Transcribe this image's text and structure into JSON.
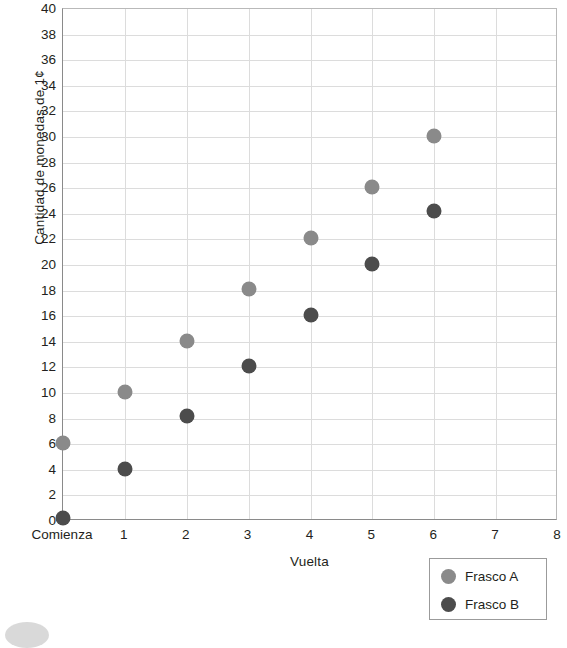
{
  "chart_data": {
    "type": "scatter",
    "title": "",
    "xlabel": "Vuelta",
    "ylabel": "Cantidad de monedas de 1¢",
    "xlim": [
      0,
      8
    ],
    "ylim": [
      0,
      40
    ],
    "grid": true,
    "x_tick_labels": [
      "Comienza",
      "1",
      "2",
      "3",
      "4",
      "5",
      "6",
      "7",
      "8"
    ],
    "x_tick_values": [
      0,
      1,
      2,
      3,
      4,
      5,
      6,
      7,
      8
    ],
    "y_tick_labels": [
      "0",
      "2",
      "4",
      "6",
      "8",
      "10",
      "12",
      "14",
      "16",
      "18",
      "20",
      "22",
      "24",
      "26",
      "28",
      "30",
      "32",
      "34",
      "36",
      "38",
      "40"
    ],
    "y_tick_values": [
      0,
      2,
      4,
      6,
      8,
      10,
      12,
      14,
      16,
      18,
      20,
      22,
      24,
      26,
      28,
      30,
      32,
      34,
      36,
      38,
      40
    ],
    "legend_position": "bottom-right",
    "series": [
      {
        "name": "Frasco A",
        "color": "#8a8a8a",
        "marker": "circle",
        "x": [
          0,
          1,
          2,
          3,
          4,
          5,
          6
        ],
        "values": [
          6.1,
          10.1,
          14.1,
          18.1,
          22.1,
          26.1,
          30.1
        ]
      },
      {
        "name": "Frasco B",
        "color": "#4c4c4c",
        "marker": "circle",
        "x": [
          0,
          1,
          2,
          3,
          4,
          5,
          6
        ],
        "values": [
          0.2,
          4.1,
          8.2,
          12.1,
          16.1,
          20.1,
          24.2
        ]
      }
    ]
  },
  "legend": {
    "entries": [
      {
        "label": "Frasco A",
        "color": "#8a8a8a"
      },
      {
        "label": "Frasco B",
        "color": "#4c4c4c"
      }
    ]
  },
  "colors": {
    "frasco_a": "#8a8a8a",
    "frasco_b": "#4c4c4c",
    "gridline": "#dcdcdc",
    "axis": "#8a8a8a",
    "text": "#231f20"
  }
}
